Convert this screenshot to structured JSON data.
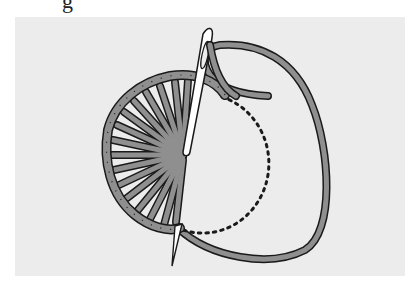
{
  "caption": {
    "fragment": "g"
  },
  "diagram": {
    "elements": [
      {
        "name": "needle-upper",
        "description": "needle with eye emerging from fabric at wheel center, pointing down"
      },
      {
        "name": "needle-tip-lower",
        "description": "needle point exiting fabric at lower-left of circle"
      },
      {
        "name": "thread-loop",
        "description": "working thread looping around to the right"
      },
      {
        "name": "fan-stitches",
        "description": "radiating stitches forming the completed left half of the wheel"
      },
      {
        "name": "dotted-guide",
        "description": "dotted semicircle marking remaining outline on the right"
      }
    ],
    "colors": {
      "background": "#ececec",
      "thread_fill": "#8f8f8f",
      "outline": "#1a1a1a",
      "needle": "#ffffff"
    }
  }
}
